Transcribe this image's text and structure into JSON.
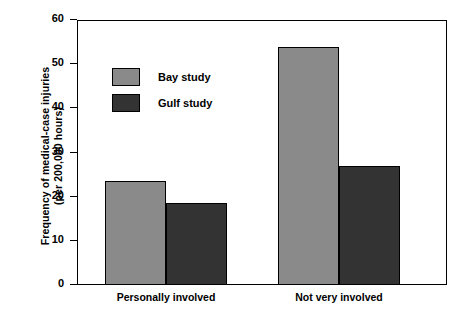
{
  "chart_data": {
    "type": "bar",
    "title": "",
    "xlabel": "",
    "ylabel": "Frequency of medical-case injuries\n(per 200,000 hours)",
    "categories": [
      "Personally involved",
      "Not very involved"
    ],
    "series": [
      {
        "name": "Bay study",
        "values": [
          23.5,
          54
        ],
        "color": "#8a8a8a"
      },
      {
        "name": "Gulf study",
        "values": [
          18.5,
          27
        ],
        "color": "#333333"
      }
    ],
    "ylim": [
      0,
      60
    ],
    "yticks": [
      0,
      10,
      20,
      30,
      40,
      50,
      60
    ],
    "ytick_labels": [
      "0",
      "10",
      "20",
      "30",
      "40",
      "50",
      "60"
    ],
    "grid": false,
    "legend_position": "upper left inside",
    "frame": "box"
  },
  "axis": {
    "y_title": "Frequency of medical-case injuries\n(per 200,000 hours)"
  },
  "legend": {
    "items": [
      {
        "label": "Bay study"
      },
      {
        "label": "Gulf study"
      }
    ]
  }
}
